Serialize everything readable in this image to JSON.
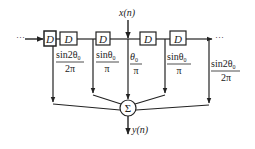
{
  "diagram": {
    "title": "",
    "input": {
      "label": "x(n)"
    },
    "output": {
      "label": "y(n)"
    },
    "continuation": {
      "left": "···",
      "right": "···"
    },
    "delay_label": "D",
    "delays": [
      {
        "id": "d1",
        "label": "D"
      },
      {
        "id": "d2",
        "label": "D"
      },
      {
        "id": "d3",
        "label": "D"
      },
      {
        "id": "d4",
        "label": "D"
      },
      {
        "id": "d5",
        "label": "D"
      }
    ],
    "summer": {
      "symbol": "Σ"
    },
    "taps": [
      {
        "position": "far-left",
        "numerator": "sin2θ",
        "sub": "0",
        "denominator": "2π"
      },
      {
        "position": "left",
        "numerator": "sinθ",
        "sub": "0",
        "denominator": "π"
      },
      {
        "position": "center",
        "numerator": "θ",
        "sub": "0",
        "denominator": "π"
      },
      {
        "position": "right",
        "numerator": "sinθ",
        "sub": "0",
        "denominator": "π"
      },
      {
        "position": "far-right",
        "numerator": "sin2θ",
        "sub": "0",
        "denominator": "2π"
      }
    ],
    "colors": {
      "line": "#222222",
      "background": "#ffffff"
    }
  }
}
